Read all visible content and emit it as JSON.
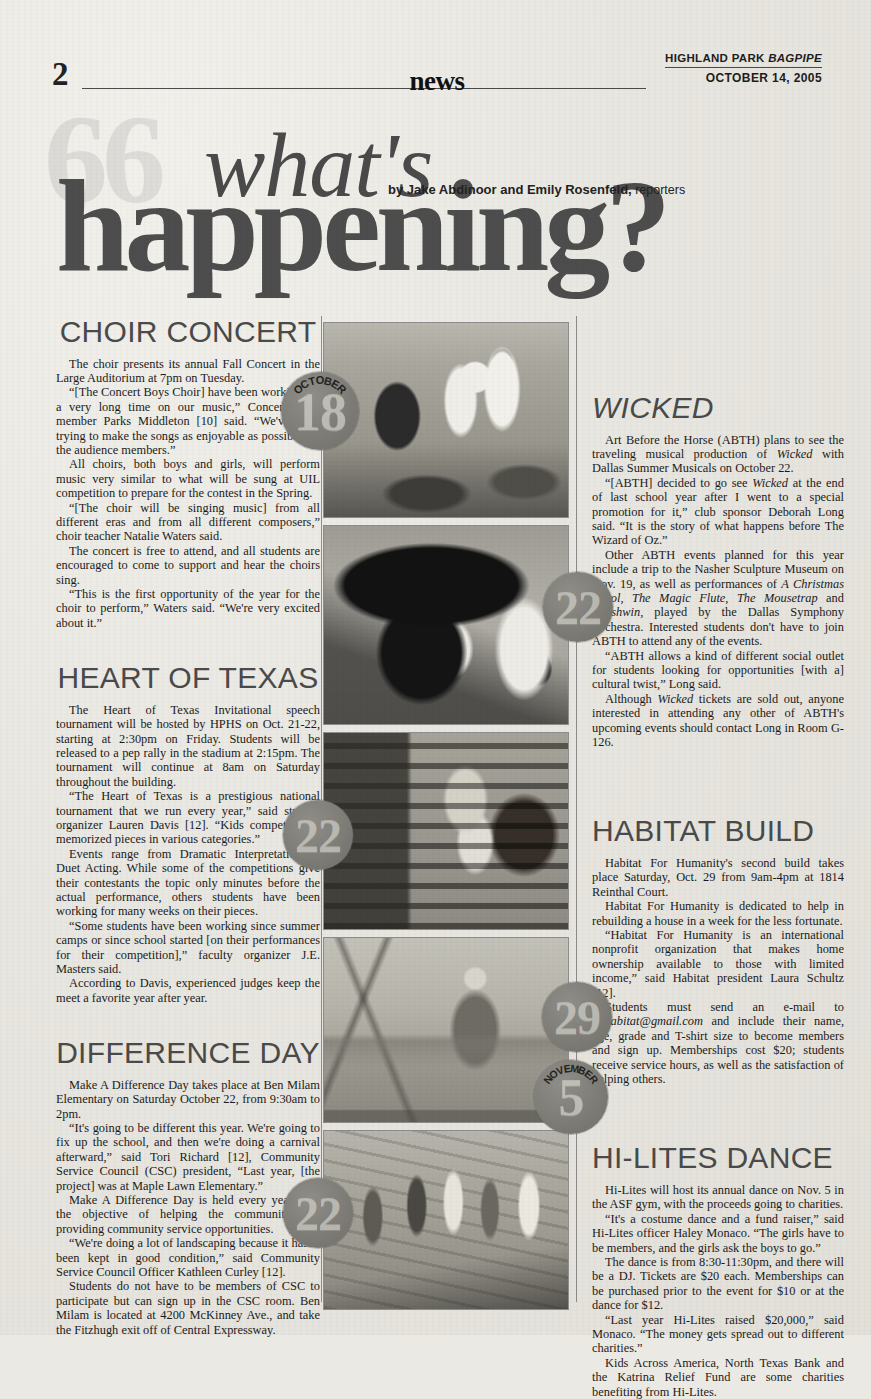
{
  "page": {
    "folio": "2",
    "section": "news",
    "publication_line": "HIGHLAND PARK ",
    "publication_italic": "BAGPIPE",
    "date": "OCTOBER 14, 2005"
  },
  "title": {
    "line1": "what's",
    "line2": "happening?",
    "ghost": "66",
    "byline_prefix": "by Jake Abdinoor and Emily Rosenfeld,",
    "byline_role": " reporters"
  },
  "articles": {
    "choir": {
      "heading": "CHOIR CONCERT",
      "paragraphs": [
        "The choir presents its annual Fall Concert in the Large Auditorium at 7pm on Tuesday.",
        "“[The Concert Boys Choir] have been working for a very long time on our music,” Concert Boys member Parks Middleton [10] said. “We've been trying to make the songs as enjoyable as possible for the audience members.”",
        "All choirs, both boys and girls, will perform music very similar to what will be sung at UIL competition to prepare for the contest in the Spring.",
        "“[The choir will be singing music] from all different eras and from all different composers,” choir teacher Natalie Waters said.",
        "The concert is free to attend, and all students are encouraged to come to support and hear the choirs sing.",
        "“This is the first opportunity of the year for the choir to perform,” Waters said. “We're very excited about it.”"
      ]
    },
    "heart_of_texas": {
      "heading": "HEART OF TEXAS",
      "paragraphs": [
        "The Heart of Texas Invitational speech tournament will be hosted by HPHS on Oct. 21-22, starting at 2:30pm on Friday. Students will be released to a pep rally in the stadium at 2:15pm. The tournament will continue at 8am on Saturday throughout the building.",
        "“The Heart of Texas is a prestigious national tournament that we run every year,” said student organizer Lauren Davis [12]. “Kids compete with memorized pieces in various categories.”",
        "Events range from Dramatic Interpretation to Duet Acting. While some of the competitions give their contestants the topic only minutes before the actual performance, others students have been working for many weeks on their pieces.",
        "“Some students have been working since summer camps or since school started [on their performances for their competition],” faculty organizer J.E. Masters said.",
        "According to Davis, experienced judges keep the meet a favorite year after year."
      ]
    },
    "difference_day": {
      "heading": "DIFFERENCE DAY",
      "paragraphs": [
        "Make A Difference Day takes place at Ben Milam Elementary on Saturday October 22, from 9:30am to 2pm.",
        "“It's going to be different this year. We're going to fix up the school, and then we're doing a carnival afterward,” said Tori Richard [12], Community Service Council (CSC) president, “Last year, [the project] was at Maple Lawn Elementary.”",
        "Make A Difference Day is held every year with the objective of helping the community and providing community service opportunities.",
        "“We're doing a lot of landscaping because it hasn't been kept in good condition,” said Community Service Council Officer Kathleen Curley [12].",
        "Students do not have to be members of CSC to participate but can sign up in the CSC room. Ben Milam is located at 4200 McKinney Ave., and take the Fitzhugh exit off of Central Expressway."
      ]
    },
    "wicked": {
      "heading": "WICKED",
      "paragraphs": [
        "Art Before the Horse (ABTH) plans to see the traveling musical production of <em>Wicked</em> with Dallas Summer Musicals on October 22.",
        "“[ABTH] decided to go see <em>Wicked</em> at the end of last school year after I went to a special promotion for it,” club sponsor Deborah Long said. “It is the story of what happens before The Wizard of Oz.”",
        "Other ABTH events planned for this year include a trip to the Nasher Sculpture Museum on Nov. 19, as well as performances of <em>A Christmas Carol, The Magic Flute, The Mousetrap</em> and <em>Gershwin</em>, played by the Dallas Symphony Orchestra. Interested students don't have to join ABTH to attend any of the events.",
        "“ABTH allows a kind of different social outlet for students looking for opportunities [with a] cultural twist,” Long said.",
        "Although <em>Wicked</em> tickets are sold out, anyone interested in attending any other of ABTH's upcoming events should contact Long in Room G-126."
      ]
    },
    "habitat": {
      "heading": "HABITAT BUILD",
      "paragraphs": [
        "Habitat For Humanity's second build takes place Saturday, Oct. 29 from 9am-4pm at 1814 Reinthal Court.",
        "Habitat For Humanity is dedicated to help in rebuilding a house in a week for the less fortunate.",
        "“Habitat For Humanity is an international nonprofit organization that makes home ownership available to those with limited income,” said Habitat president Laura Schultz [12].",
        "Students must send an e-mail to <em>hphabitat@gmail.com</em> and include their name, age, grade and T-shirt size to become members and sign up. Memberships cost $20; students receive service hours, as well as the satisfaction of helping others."
      ]
    },
    "hilites": {
      "heading": "HI-LITES DANCE",
      "paragraphs": [
        "Hi-Lites will host its annual dance on Nov. 5 in the ASF gym, with the proceeds going to charities.",
        "“It's a costume dance and a fund raiser,” said Hi-Lites officer Haley Monaco. “The girls have to be members, and the girls ask the boys to go.”",
        "The dance is from 8:30-11:30pm, and there will be a DJ. Tickets are $20 each. Memberships can be purchased prior to the event for $10 or at the dance for $12.",
        "“Last year Hi-Lites raised $20,000,” said Monaco. “The money gets spread out to different charities.”",
        "Kids Across America, North Texas Bank and the Katrina Relief Fund are some charities benefiting from Hi-Lites."
      ]
    }
  },
  "badges": [
    {
      "id": "badge-choir",
      "month": "OCTOBER",
      "day": "18"
    },
    {
      "id": "badge-wicked",
      "month": "",
      "day": "22"
    },
    {
      "id": "badge-heart",
      "month": "",
      "day": "22"
    },
    {
      "id": "badge-habitat",
      "month": "",
      "day": "29"
    },
    {
      "id": "badge-hilites",
      "month": "NOVEMBER",
      "day": "5"
    },
    {
      "id": "badge-difference",
      "month": "",
      "day": "22"
    }
  ],
  "photos": [
    {
      "id": "photo-choir-rehearsal",
      "alt": "Choir students rehearsing with sheet music"
    },
    {
      "id": "photo-wicked-witch",
      "alt": "Close-up of witch in black pointed hat"
    },
    {
      "id": "photo-student-reading",
      "alt": "Student reading in library armchair"
    },
    {
      "id": "photo-habitat-build",
      "alt": "Volunteer at construction site with sawhorse"
    },
    {
      "id": "photo-service-day",
      "alt": "Students raking and cleaning outdoors"
    }
  ],
  "colors": {
    "paper": "#ebe9e4",
    "ink": "#1a1a1a",
    "heading_gray": "#4a4a4a",
    "badge_gray": "#7d7c76"
  }
}
